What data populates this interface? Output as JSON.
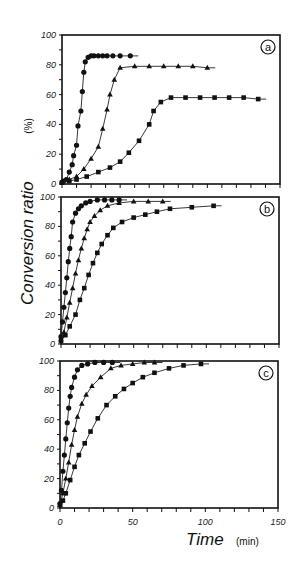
{
  "chart_data": {
    "type": "line",
    "ylabel": "Conversion ratio",
    "ylabel_unit": "(%)",
    "xlabel": "Time",
    "xlabel_unit": "(min)",
    "x_ticks": [
      "0",
      "50",
      "100",
      "150"
    ],
    "y_ticks": [
      "0",
      "20",
      "40",
      "60",
      "80",
      "100"
    ],
    "xlim": [
      0,
      150
    ],
    "ylim": [
      0,
      100
    ],
    "grid": false,
    "panels": [
      {
        "label": "a",
        "series": [
          {
            "name": "circles",
            "marker": "circle",
            "x": [
              0,
              1,
              3,
              5,
              7,
              8,
              10,
              11,
              13,
              14,
              15,
              16,
              18,
              20,
              22,
              25,
              28,
              31,
              35,
              40,
              47
            ],
            "y": [
              1,
              2,
              3,
              8,
              13,
              19,
              26,
              39,
              49,
              62,
              75,
              82,
              85,
              86,
              86,
              86,
              86,
              86,
              86,
              86,
              86
            ]
          },
          {
            "name": "triangles",
            "marker": "triangle",
            "x": [
              0,
              5,
              10,
              15,
              20,
              25,
              28,
              31,
              33,
              36,
              40,
              50,
              60,
              70,
              80,
              90,
              100
            ],
            "y": [
              1,
              3,
              5,
              10,
              17,
              25,
              37,
              50,
              60,
              70,
              78,
              79,
              79,
              79,
              79,
              79,
              78
            ]
          },
          {
            "name": "squares",
            "marker": "square",
            "x": [
              0,
              5,
              10,
              17,
              25,
              33,
              40,
              46,
              53,
              60,
              63,
              68,
              75,
              85,
              95,
              105,
              115,
              125,
              135
            ],
            "y": [
              1,
              2,
              3,
              5,
              8,
              11,
              15,
              21,
              29,
              40,
              49,
              55,
              58,
              58,
              58,
              58,
              58,
              58,
              57
            ]
          }
        ]
      },
      {
        "label": "b",
        "series": [
          {
            "name": "circles",
            "marker": "circle",
            "x": [
              0,
              1,
              2,
              3,
              4,
              5,
              6,
              7,
              8,
              10,
              12,
              14,
              17,
              20,
              25,
              30,
              35,
              40
            ],
            "y": [
              5,
              15,
              25,
              35,
              45,
              56,
              65,
              73,
              83,
              89,
              92,
              94,
              96,
              97,
              98,
              98,
              98,
              98
            ]
          },
          {
            "name": "triangles",
            "marker": "triangle",
            "x": [
              0,
              2,
              4,
              6,
              8,
              10,
              12,
              14,
              16,
              18,
              20,
              23,
              27,
              32,
              40,
              50,
              60,
              70
            ],
            "y": [
              3,
              8,
              18,
              28,
              38,
              48,
              57,
              65,
              72,
              78,
              83,
              87,
              91,
              94,
              96,
              97,
              97,
              97
            ]
          },
          {
            "name": "squares",
            "marker": "square",
            "x": [
              0,
              3,
              6,
              10,
              13,
              16,
              19,
              22,
              25,
              28,
              32,
              36,
              42,
              50,
              58,
              66,
              75,
              90,
              105
            ],
            "y": [
              2,
              6,
              12,
              20,
              30,
              38,
              47,
              55,
              62,
              68,
              74,
              79,
              83,
              86,
              88,
              90,
              92,
              93,
              94
            ]
          }
        ]
      },
      {
        "label": "c",
        "series": [
          {
            "name": "circles",
            "marker": "circle",
            "x": [
              0,
              1,
              2,
              3,
              4,
              5,
              6,
              7,
              8,
              10,
              12,
              15,
              19,
              24,
              30,
              36
            ],
            "y": [
              3,
              12,
              25,
              36,
              47,
              58,
              68,
              76,
              82,
              89,
              94,
              97,
              98,
              99,
              99,
              99
            ]
          },
          {
            "name": "triangles",
            "marker": "triangle",
            "x": [
              0,
              2,
              4,
              6,
              8,
              10,
              12,
              15,
              18,
              22,
              28,
              35,
              42,
              50,
              58,
              65
            ],
            "y": [
              2,
              10,
              20,
              31,
              43,
              53,
              62,
              71,
              77,
              83,
              89,
              95,
              97,
              98,
              99,
              99
            ]
          },
          {
            "name": "squares",
            "marker": "square",
            "x": [
              0,
              2,
              4,
              7,
              10,
              13,
              17,
              21,
              26,
              32,
              38,
              44,
              50,
              57,
              65,
              75,
              85,
              97
            ],
            "y": [
              2,
              5,
              10,
              19,
              28,
              36,
              44,
              52,
              61,
              70,
              76,
              81,
              85,
              89,
              92,
              95,
              97,
              98
            ]
          }
        ]
      }
    ]
  }
}
